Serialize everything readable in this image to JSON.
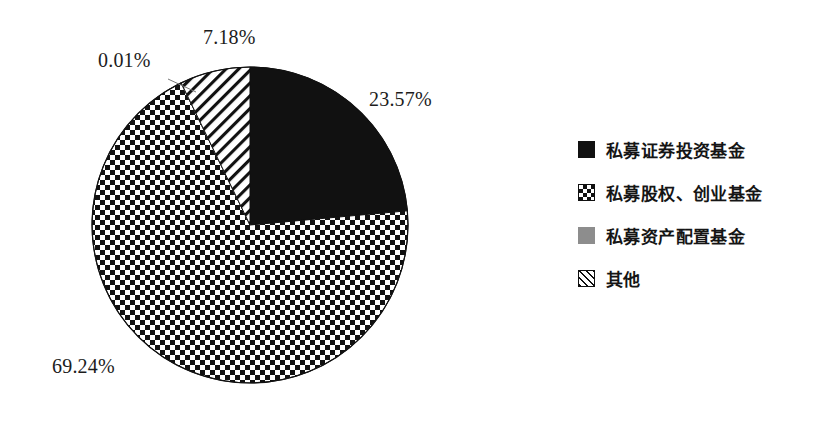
{
  "chart_data": {
    "type": "pie",
    "title": "",
    "subtitle": "",
    "xlabel": "",
    "ylabel": "",
    "legend_position": "right",
    "grid": false,
    "start_angle_deg": 0,
    "direction": "clockwise",
    "categories": [
      "私募证券投资基金",
      "私募股权、创业基金",
      "私募资产配置基金",
      "其他"
    ],
    "values": [
      23.57,
      69.24,
      0.01,
      7.18
    ],
    "value_labels": [
      "23.57%",
      "69.24%",
      "0.01%",
      "7.18%"
    ],
    "units": "percent",
    "slices": [
      {
        "name": "私募证券投资基金",
        "value": 23.57,
        "label": "23.57%",
        "fill": "solid-black",
        "color": "#111111",
        "start_deg": 0.0,
        "end_deg": 84.852
      },
      {
        "name": "私募股权、创业基金",
        "value": 69.24,
        "label": "69.24%",
        "fill": "checkerboard",
        "color": "#111111",
        "start_deg": 84.852,
        "end_deg": 334.116
      },
      {
        "name": "私募资产配置基金",
        "value": 0.01,
        "label": "0.01%",
        "fill": "solid-gray",
        "color": "#8d8d8d",
        "start_deg": 334.116,
        "end_deg": 334.152
      },
      {
        "name": "其他",
        "value": 7.18,
        "label": "7.18%",
        "fill": "diagonal-hatch",
        "color": "#111111",
        "start_deg": 334.152,
        "end_deg": 360.0
      }
    ]
  },
  "pie": {
    "center_x": 250,
    "center_y": 225,
    "radius": 158,
    "outline_color": "#111111"
  },
  "labels": {
    "securities_pct": "23.57%",
    "equity_pct": "69.24%",
    "allocation_pct": "0.01%",
    "other_pct": "7.18%"
  },
  "legend": {
    "items": [
      {
        "label": "私募证券投资基金",
        "swatch": "solid-black-square-icon",
        "color": "#111111"
      },
      {
        "label": "私募股权、创业基金",
        "swatch": "checkerboard-square-icon",
        "color": "#111111"
      },
      {
        "label": "私募资产配置基金",
        "swatch": "gray-square-icon",
        "color": "#8d8d8d"
      },
      {
        "label": "其他",
        "swatch": "diagonal-hatch-square-icon",
        "color": "#111111"
      }
    ]
  }
}
